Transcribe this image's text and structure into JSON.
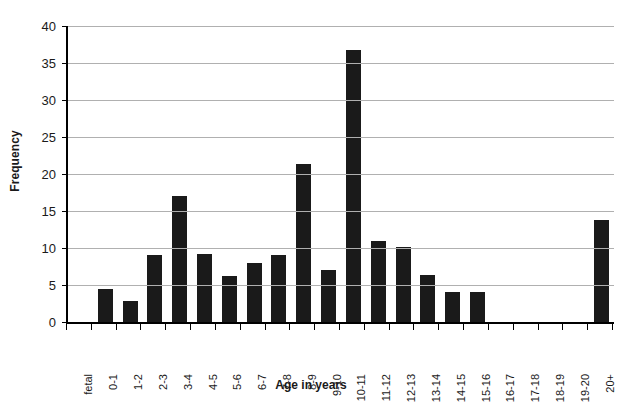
{
  "chart_data": {
    "type": "bar",
    "title": "",
    "xlabel": "Age in years",
    "ylabel": "Frequency",
    "categories": [
      "fetal",
      "0-1",
      "1-2",
      "2-3",
      "3-4",
      "4-5",
      "5-6",
      "6-7",
      "7-8",
      "8-9",
      "9-10",
      "10-11",
      "11-12",
      "12-13",
      "13-14",
      "14-15",
      "15-16",
      "16-17",
      "17-18",
      "18-19",
      "19-20",
      "20+"
    ],
    "values": [
      0,
      4.4,
      2.9,
      9.0,
      17.0,
      9.2,
      6.2,
      8.0,
      9.1,
      21.4,
      7.0,
      36.7,
      11.0,
      10.1,
      6.4,
      4.1,
      4.1,
      0,
      0,
      0,
      0,
      13.8
    ],
    "ylim": [
      0,
      40
    ],
    "ytick_values": [
      0,
      5,
      10,
      15,
      20,
      25,
      30,
      35,
      40
    ],
    "ytick_labels": [
      "0",
      "5",
      "10",
      "15",
      "20",
      "25",
      "30",
      "35",
      "40"
    ],
    "grid": true,
    "grid_axis": "y",
    "legend": false,
    "bar_color": "#1a1a1a",
    "grid_color": "#b0b0b0",
    "axis_color": "#000000"
  }
}
